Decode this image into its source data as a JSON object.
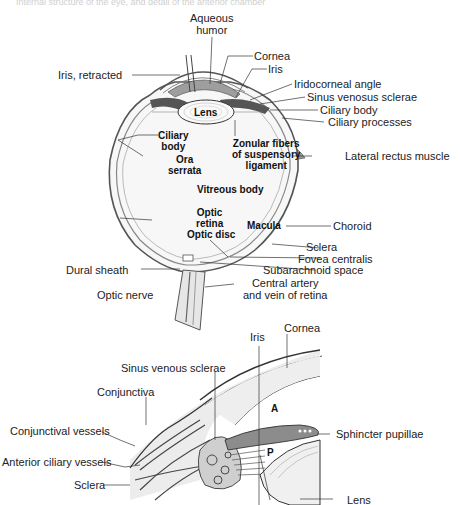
{
  "header": {
    "faint_caption": "Internal structure of the eye, and detail of the anterior chamber"
  },
  "top_diagram": {
    "title": "Sagittal section of the eye",
    "labels": {
      "aqueous_humor": "Aqueous\nhumor",
      "aqueous_humor_l1": "Aqueous",
      "aqueous_humor_l2": "humor",
      "iris_retracted": "Iris, retracted",
      "cornea": "Cornea",
      "iris": "Iris",
      "iridocorneal_angle": "Iridocorneal angle",
      "sinus_venosus_sclerae": "Sinus venosus sclerae",
      "ciliary_body_right": "Ciliary body",
      "ciliary_processes": "Ciliary processes",
      "lens": "Lens",
      "ciliary_body_l1": "Ciliary",
      "ciliary_body_l2": "body",
      "ora_l1": "Ora",
      "ora_l2": "serrata",
      "zonular_l1": "Zonular fibers",
      "zonular_l2": "of suspensory",
      "zonular_l3": "ligament",
      "lateral_rectus": "Lateral rectus muscle",
      "vitreous_body": "Vitreous body",
      "optic_retina_l1": "Optic",
      "optic_retina_l2": "retina",
      "macula": "Macula",
      "optic_disc": "Optic disc",
      "choroid": "Choroid",
      "sclera": "Sclera",
      "fovea_centralis": "Fovea centralis",
      "dural_sheath": "Dural sheath",
      "subarachnoid_space": "Subarachnoid space",
      "central_artery_l1": "Central artery",
      "central_artery_l2": "and vein of retina",
      "optic_nerve": "Optic nerve"
    }
  },
  "bottom_diagram": {
    "title": "Detail of iridocorneal angle",
    "labels": {
      "cornea": "Cornea",
      "iris": "Iris",
      "sinus_venous_sclerae": "Sinus venous sclerae",
      "conjunctiva": "Conjunctiva",
      "conjunctival_vessels": "Conjunctival vessels",
      "anterior_ciliary_vessels": "Anterior ciliary vessels",
      "sclera": "Sclera",
      "anterior_chamber": "A",
      "posterior_chamber": "P",
      "sphincter_pupillae": "Sphincter pupillae",
      "lens": "Lens"
    }
  },
  "colors": {
    "line": "#333333",
    "fill_light": "#eeeeee",
    "fill_mid": "#bdbdbd",
    "fill_dark": "#6e6e6e"
  }
}
